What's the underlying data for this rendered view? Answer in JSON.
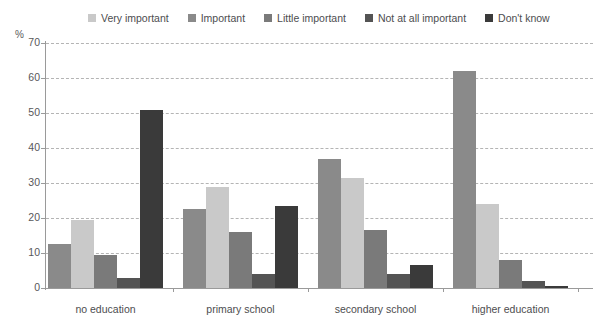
{
  "chart_data": {
    "type": "bar",
    "title": "",
    "subtitle": "",
    "xlabel": "",
    "ylabel": "%",
    "ylim": [
      0,
      70
    ],
    "yticks": [
      0,
      10,
      20,
      30,
      40,
      50,
      60,
      70
    ],
    "grid": true,
    "legend_position": "top",
    "categories": [
      "no education",
      "primary school",
      "secondary school",
      "higher education"
    ],
    "series": [
      {
        "name": "Very important",
        "color": "#c9c9c9",
        "values": [
          19.5,
          22.5,
          37.0,
          62.0
        ]
      },
      {
        "name": "Important",
        "color": "#8a8a8a",
        "values": [
          12.5,
          29.0,
          31.5,
          24.0
        ]
      },
      {
        "name": "Little important",
        "color": "#7a7a7a",
        "values": [
          9.5,
          16.0,
          16.5,
          8.0
        ]
      },
      {
        "name": "Not at all important",
        "color": "#545454",
        "values": [
          3.0,
          4.0,
          4.0,
          2.0
        ]
      },
      {
        "name": "Don't know",
        "color": "#3a3a3a",
        "values": [
          51.0,
          23.5,
          6.5,
          0.5
        ]
      }
    ],
    "bar_order_in_group": [
      "Important",
      "Very important",
      "Little important",
      "Not at all important",
      "Don't know"
    ],
    "group_bar_values": [
      {
        "category": "no education",
        "values": [
          12.5,
          19.5,
          9.5,
          3.0,
          51.0
        ]
      },
      {
        "category": "primary school",
        "values": [
          22.5,
          29.0,
          16.0,
          4.0,
          23.5
        ]
      },
      {
        "category": "secondary school",
        "values": [
          37.0,
          31.5,
          16.5,
          4.0,
          6.5
        ]
      },
      {
        "category": "higher education",
        "values": [
          62.0,
          24.0,
          8.0,
          2.0,
          0.5
        ]
      }
    ]
  },
  "legend": {
    "items": [
      {
        "label": "Very important",
        "color": "#c9c9c9"
      },
      {
        "label": "Important",
        "color": "#8a8a8a"
      },
      {
        "label": "Little important",
        "color": "#7a7a7a"
      },
      {
        "label": "Not at all important",
        "color": "#545454"
      },
      {
        "label": "Don't know",
        "color": "#3a3a3a"
      }
    ]
  },
  "axis": {
    "unit_label": "%",
    "y_ticks": [
      "70",
      "60",
      "50",
      "40",
      "30",
      "20",
      "10",
      "0"
    ]
  },
  "x_categories": [
    "no education",
    "primary school",
    "secondary school",
    "higher education"
  ],
  "colors": {
    "grid": "#b4b4b4",
    "axis": "#9a9a9a",
    "text": "#58585a",
    "background": "#ffffff"
  }
}
